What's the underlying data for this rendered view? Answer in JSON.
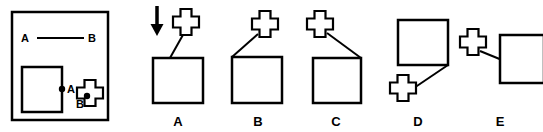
{
  "figure": {
    "type": "spatial-reasoning-multiple-choice",
    "background_color": "#ffffff",
    "ink_color": "#000000",
    "reference_panel": {
      "name": "reference-panel",
      "border": true,
      "frame": {
        "x": 12,
        "y": 12,
        "width": 96,
        "height": 108,
        "stroke_width": 2.5
      },
      "relation_line": {
        "label_left": "A",
        "label_right": "B",
        "x1": 37,
        "y1": 38,
        "x2": 84,
        "y2": 38,
        "stroke_width": 2
      },
      "label_left_pos": {
        "x": 21,
        "y": 42
      },
      "label_right_pos": {
        "x": 88,
        "y": 42
      },
      "square": {
        "name": "reference-square",
        "x": 22,
        "y": 67,
        "width": 40,
        "height": 45,
        "stroke_width": 2.5
      },
      "square_point": {
        "name": "point-a-marker",
        "label": "A",
        "cx": 62,
        "cy": 89,
        "r": 3.2,
        "label_x": 67,
        "label_y": 93
      },
      "cross": {
        "name": "reference-cross",
        "cx": 90,
        "cy": 93,
        "scale": 1.0,
        "stroke_width": 2.2
      },
      "cross_point": {
        "name": "point-b-marker",
        "label": "B",
        "cx": 87,
        "cy": 96,
        "r": 3.2,
        "label_x": 76,
        "label_y": 108
      }
    },
    "options": [
      {
        "id": "A",
        "name": "option-a",
        "label": "A",
        "label_x": 178,
        "label_y": 126,
        "has_arrow": true,
        "arrow": {
          "name": "down-arrow-indicator",
          "x": 157,
          "y_top": 6,
          "y_bottom": 36,
          "shaft_width": 3.5,
          "head_width": 13,
          "head_height": 12
        },
        "square": {
          "x": 153,
          "y": 58,
          "width": 50,
          "height": 45,
          "stroke_width": 2.5
        },
        "cross": {
          "cx": 186,
          "cy": 22,
          "scale": 1.0,
          "stroke_width": 2.2
        },
        "connector": {
          "x1": 184,
          "y1": 33,
          "x2": 170,
          "y2": 58,
          "stroke_width": 2
        }
      },
      {
        "id": "B",
        "name": "option-b",
        "label": "B",
        "label_x": 258,
        "label_y": 126,
        "has_arrow": false,
        "square": {
          "x": 232,
          "y": 57,
          "width": 50,
          "height": 46,
          "stroke_width": 2.5
        },
        "cross": {
          "cx": 265,
          "cy": 24,
          "scale": 1.0,
          "stroke_width": 2.2
        },
        "connector": {
          "x1": 258,
          "y1": 34,
          "x2": 232,
          "y2": 57,
          "stroke_width": 2
        }
      },
      {
        "id": "C",
        "name": "option-c",
        "label": "C",
        "label_x": 336,
        "label_y": 126,
        "has_arrow": false,
        "square": {
          "x": 313,
          "y": 58,
          "width": 48,
          "height": 45,
          "stroke_width": 2.5
        },
        "cross": {
          "cx": 320,
          "cy": 24,
          "scale": 1.0,
          "stroke_width": 2.2
        },
        "connector": {
          "x1": 327,
          "y1": 33,
          "x2": 361,
          "y2": 58,
          "stroke_width": 2
        }
      },
      {
        "id": "D",
        "name": "option-d",
        "label": "D",
        "label_x": 418,
        "label_y": 126,
        "has_arrow": false,
        "square": {
          "x": 398,
          "y": 20,
          "width": 50,
          "height": 45,
          "stroke_width": 2.5
        },
        "cross": {
          "cx": 403,
          "cy": 88,
          "scale": 1.0,
          "stroke_width": 2.2
        },
        "connector": {
          "x1": 448,
          "y1": 65,
          "x2": 408,
          "y2": 92,
          "stroke_width": 2
        }
      },
      {
        "id": "E",
        "name": "option-e",
        "label": "E",
        "label_x": 500,
        "label_y": 126,
        "has_arrow": false,
        "square": {
          "x": 500,
          "y": 35,
          "width": 44,
          "height": 48,
          "stroke_width": 2.5
        },
        "cross": {
          "cx": 473,
          "cy": 42,
          "scale": 1.0,
          "stroke_width": 2.2
        },
        "connector": {
          "x1": 480,
          "y1": 51,
          "x2": 502,
          "y2": 60,
          "stroke_width": 2
        }
      }
    ]
  }
}
